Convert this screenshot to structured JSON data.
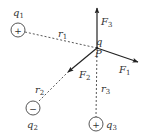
{
  "diagram": {
    "type": "electrostatic-force-diagram",
    "colors": {
      "stroke": "#333333",
      "background": "#ffffff"
    },
    "point": {
      "charge_label": "q",
      "point_label": "P"
    },
    "charges": [
      {
        "name": "q",
        "sub": "1",
        "sign": "+",
        "distance_label": "r",
        "distance_sub": "1"
      },
      {
        "name": "q",
        "sub": "2",
        "sign": "−",
        "distance_label": "r",
        "distance_sub": "2"
      },
      {
        "name": "q",
        "sub": "3",
        "sign": "+",
        "distance_label": "r",
        "distance_sub": "3"
      }
    ],
    "forces": [
      {
        "name": "F",
        "sub": "1"
      },
      {
        "name": "F",
        "sub": "2"
      },
      {
        "name": "F",
        "sub": "3"
      }
    ]
  }
}
